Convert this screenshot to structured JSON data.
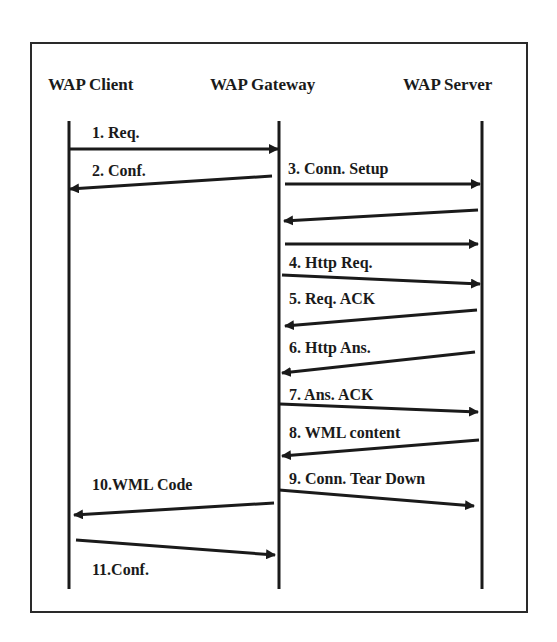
{
  "diagram": {
    "type": "sequence-diagram",
    "participants": [
      {
        "id": "client",
        "label": "WAP Client",
        "x": 69,
        "label_x": 48
      },
      {
        "id": "gateway",
        "label": "WAP Gateway",
        "x": 279,
        "label_x": 210
      },
      {
        "id": "server",
        "label": "WAP Server",
        "x": 482,
        "label_x": 403
      }
    ],
    "messages": [
      {
        "num": 1,
        "label": "1. Req.",
        "from": "client",
        "to": "gateway",
        "x1": 69,
        "y1": 149,
        "x2": 278,
        "y2": 149,
        "label_x": 92,
        "label_y": 138
      },
      {
        "num": 2,
        "label": "2. Conf.",
        "from": "gateway",
        "to": "client",
        "x1": 272,
        "y1": 176,
        "x2": 70,
        "y2": 189,
        "label_x": 92,
        "label_y": 176
      },
      {
        "num": 3,
        "label": "3. Conn. Setup",
        "from": "gateway",
        "to": "server",
        "x1": 285,
        "y1": 184,
        "x2": 480,
        "y2": 184,
        "label_x": 288,
        "label_y": 174
      },
      {
        "num": null,
        "label": "",
        "from": "server",
        "to": "gateway",
        "x1": 478,
        "y1": 210,
        "x2": 284,
        "y2": 221,
        "label_x": 0,
        "label_y": 0
      },
      {
        "num": null,
        "label": "",
        "from": "gateway",
        "to": "server",
        "x1": 285,
        "y1": 244,
        "x2": 478,
        "y2": 244,
        "label_x": 0,
        "label_y": 0
      },
      {
        "num": 4,
        "label": "4. Http Req.",
        "from": "gateway",
        "to": "server",
        "x1": 282,
        "y1": 275,
        "x2": 480,
        "y2": 284,
        "label_x": 289,
        "label_y": 268
      },
      {
        "num": 5,
        "label": "5. Req. ACK",
        "from": "server",
        "to": "gateway",
        "x1": 477,
        "y1": 310,
        "x2": 285,
        "y2": 326,
        "label_x": 289,
        "label_y": 304
      },
      {
        "num": 6,
        "label": "6. Http Ans.",
        "from": "server",
        "to": "gateway",
        "x1": 475,
        "y1": 352,
        "x2": 282,
        "y2": 373,
        "label_x": 289,
        "label_y": 353
      },
      {
        "num": 7,
        "label": "7. Ans. ACK",
        "from": "gateway",
        "to": "server",
        "x1": 280,
        "y1": 404,
        "x2": 478,
        "y2": 412,
        "label_x": 289,
        "label_y": 400
      },
      {
        "num": 8,
        "label": "8. WML content",
        "from": "server",
        "to": "gateway",
        "x1": 479,
        "y1": 440,
        "x2": 282,
        "y2": 456,
        "label_x": 289,
        "label_y": 438
      },
      {
        "num": 9,
        "label": "9. Conn. Tear Down",
        "from": "gateway",
        "to": "server",
        "x1": 279,
        "y1": 490,
        "x2": 474,
        "y2": 506,
        "label_x": 289,
        "label_y": 484
      },
      {
        "num": 10,
        "label": "10.WML Code",
        "from": "gateway",
        "to": "client",
        "x1": 274,
        "y1": 503,
        "x2": 74,
        "y2": 515,
        "label_x": 92,
        "label_y": 490
      },
      {
        "num": 11,
        "label": "11.Conf.",
        "from": "client",
        "to": "gateway",
        "x1": 76,
        "y1": 540,
        "x2": 275,
        "y2": 555,
        "label_x": 92,
        "label_y": 575
      }
    ],
    "lifeline_top": 121,
    "lifeline_bottom": 589,
    "actor_label_y": 90,
    "line_color": "#1a1a1a"
  }
}
